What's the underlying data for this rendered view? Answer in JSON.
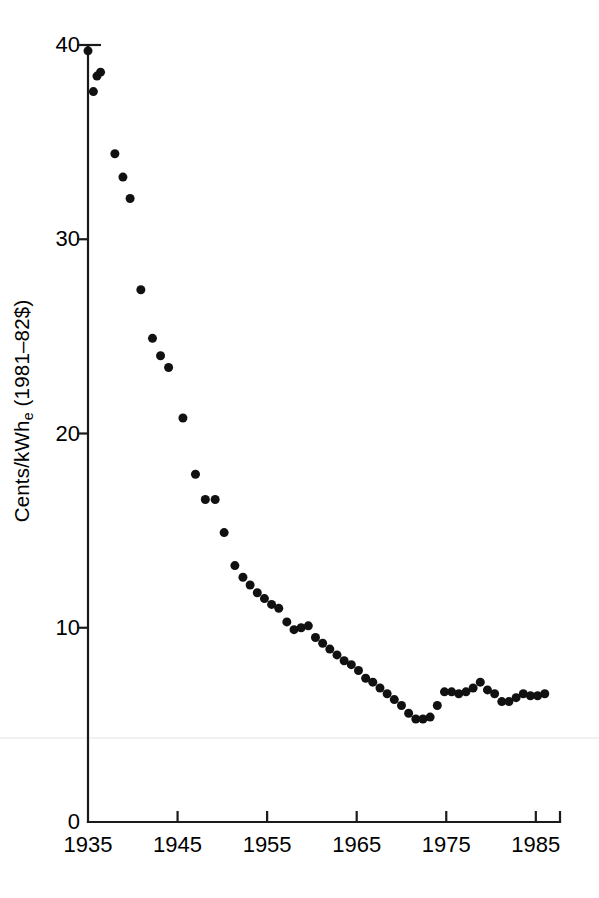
{
  "chart_data": {
    "type": "scatter",
    "title": "",
    "subtitle": "",
    "xlabel": "",
    "ylabel_text": "Cents/kWh",
    "ylabel_sub": "e",
    "ylabel_tail": " (1981–82$)",
    "ylabel_full": "Cents/kWhe (1981–82$)",
    "xlim": [
      1935,
      1987.7
    ],
    "ylim": [
      0,
      40
    ],
    "xticks": [
      1935,
      1945,
      1955,
      1965,
      1975,
      1985
    ],
    "xtick_labels": [
      "1935",
      "1945",
      "1955",
      "1965",
      "1975",
      "1985"
    ],
    "yticks": [
      0,
      10,
      20,
      30,
      40
    ],
    "ytick_labels": [
      "0",
      "10",
      "20",
      "30",
      "40"
    ],
    "grid": false,
    "legend": "none",
    "marker": "filled-circle",
    "marker_color": "#111111",
    "marker_size_px": 9,
    "series": [
      {
        "name": "Average U.S. electricity price",
        "x": [
          1935,
          1935.6,
          1936.4,
          1936.0,
          1938.0,
          1938.9,
          1939.7,
          1940.9,
          1942.2,
          1943.1,
          1944.0,
          1945.6,
          1947.0,
          1948.1,
          1949.2,
          1950.2,
          1951.4,
          1952.3,
          1953.1,
          1953.9,
          1954.7,
          1955.5,
          1956.3,
          1957.2,
          1958.0,
          1958.8,
          1959.6,
          1960.4,
          1961.2,
          1962.0,
          1962.8,
          1963.6,
          1964.4,
          1965.2,
          1966.0,
          1966.8,
          1967.6,
          1968.4,
          1969.2,
          1970.0,
          1970.8,
          1971.6,
          1972.4,
          1973.2,
          1974.0,
          1974.8,
          1975.6,
          1976.4,
          1977.2,
          1978.0,
          1978.8,
          1979.6,
          1980.4,
          1981.2,
          1982.0,
          1982.8,
          1983.6,
          1984.4,
          1985.2,
          1986.0
        ],
        "y": [
          39.7,
          37.6,
          38.6,
          38.4,
          34.4,
          33.2,
          32.1,
          27.4,
          24.9,
          24.0,
          23.4,
          20.8,
          17.9,
          16.6,
          16.6,
          14.9,
          13.2,
          12.6,
          12.2,
          11.8,
          11.5,
          11.2,
          11.0,
          10.3,
          9.9,
          10.0,
          10.1,
          9.5,
          9.2,
          8.9,
          8.6,
          8.3,
          8.1,
          7.8,
          7.4,
          7.2,
          6.9,
          6.6,
          6.3,
          6.0,
          5.6,
          5.3,
          5.3,
          5.4,
          6.0,
          6.7,
          6.7,
          6.6,
          6.7,
          6.9,
          7.2,
          6.8,
          6.6,
          6.2,
          6.2,
          6.4,
          6.6,
          6.5,
          6.5,
          6.6
        ]
      }
    ]
  },
  "plot_geometry": {
    "left_px": 88,
    "right_px": 560,
    "top_value_px": 45,
    "bottom_px": 822
  }
}
